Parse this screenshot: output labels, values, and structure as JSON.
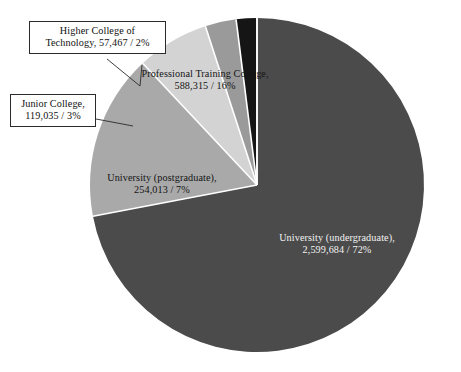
{
  "chart_data": {
    "type": "pie",
    "title": "",
    "subtitle": "",
    "xlabel": "",
    "ylabel": "",
    "legend_position": "none",
    "grid": false,
    "start_angle_deg": 0,
    "direction": "clockwise",
    "total": 3618514,
    "categories": [
      "University (undergraduate)",
      "Professional Training College",
      "University (postgraduate)",
      "Junior College",
      "Higher College of Technology"
    ],
    "values": [
      2599684,
      588315,
      254013,
      119035,
      57467
    ],
    "percent": [
      72,
      16,
      7,
      3,
      2
    ],
    "value_labels": [
      "2,599,684",
      "588,315",
      "254,013",
      "119,035",
      "57,467"
    ],
    "colors": [
      "#4b4b4b",
      "#a9a9a9",
      "#d3d3d3",
      "#9a9a9a",
      "#151515"
    ],
    "slices": [
      {
        "name": "University (undergraduate)",
        "value": 2599684,
        "value_label": "2,599,684",
        "percent": 72,
        "color": "#4b4b4b",
        "label_line_1": "University (undergraduate),",
        "label_line_2": "2,599,684 / 72%",
        "label_placement": "inside",
        "label_color": "#f2f2f2"
      },
      {
        "name": "Professional Training College",
        "value": 588315,
        "value_label": "588,315",
        "percent": 16,
        "color": "#a9a9a9",
        "label_line_1": "Professional Training College,",
        "label_line_2": "588,315 / 16%",
        "label_placement": "inside",
        "label_color": "#141414"
      },
      {
        "name": "University (postgraduate)",
        "value": 254013,
        "value_label": "254,013",
        "percent": 7,
        "color": "#d3d3d3",
        "label_line_1": "University (postgraduate),",
        "label_line_2": "254,013 / 7%",
        "label_placement": "inside",
        "label_color": "#141414"
      },
      {
        "name": "Junior College",
        "value": 119035,
        "value_label": "119,035",
        "percent": 3,
        "color": "#9a9a9a",
        "label_line_1": "Junior College,",
        "label_line_2": "119,035 / 3%",
        "label_placement": "callout",
        "label_color": "#111111"
      },
      {
        "name": "Higher College of Technology",
        "value": 57467,
        "value_label": "57,467",
        "percent": 2,
        "color": "#151515",
        "label_line_1": "Higher College of",
        "label_line_2": "Technology, 57,467 / 2%",
        "label_placement": "callout",
        "label_color": "#111111"
      }
    ]
  },
  "callouts": {
    "higher_college_of_technology": {
      "line_1": "Higher College of",
      "line_2": "Technology, 57,467 / 2%"
    },
    "junior_college": {
      "line_1": "Junior College,",
      "line_2": "119,035 / 3%"
    }
  },
  "caption": {
    "text": ""
  }
}
